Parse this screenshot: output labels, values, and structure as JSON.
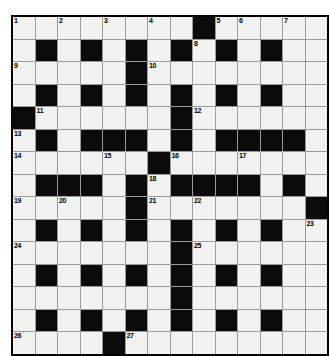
{
  "puzzle": {
    "title": "Crossword Grid",
    "type": "crossword",
    "columns": 14,
    "rows": 15,
    "cell_size_px": 21.5,
    "colors": {
      "background": "#ffffff",
      "cell_fill": "#f2f2f0",
      "block_fill": "#0b0b0b",
      "grid_line": "#9a9a9a",
      "border": "#000000",
      "number_text": "#000000"
    },
    "legend": {
      "0": "white (fillable) cell",
      "1": "black (blocked) cell"
    },
    "grid": [
      [
        0,
        0,
        0,
        0,
        0,
        0,
        0,
        0,
        1,
        0,
        0,
        0,
        0,
        0
      ],
      [
        0,
        1,
        0,
        1,
        0,
        1,
        0,
        1,
        0,
        1,
        0,
        1,
        0,
        0
      ],
      [
        0,
        0,
        0,
        0,
        0,
        1,
        0,
        0,
        0,
        0,
        0,
        0,
        0,
        0
      ],
      [
        0,
        1,
        0,
        1,
        0,
        1,
        0,
        1,
        0,
        1,
        0,
        1,
        0,
        0
      ],
      [
        1,
        0,
        0,
        0,
        0,
        0,
        0,
        1,
        0,
        0,
        0,
        0,
        0,
        0
      ],
      [
        0,
        1,
        0,
        1,
        1,
        1,
        0,
        1,
        0,
        1,
        1,
        1,
        1,
        0
      ],
      [
        0,
        0,
        0,
        0,
        0,
        0,
        1,
        0,
        0,
        0,
        0,
        0,
        0,
        0
      ],
      [
        0,
        1,
        1,
        1,
        0,
        1,
        0,
        1,
        1,
        1,
        1,
        0,
        1,
        0
      ],
      [
        0,
        0,
        0,
        0,
        0,
        1,
        0,
        0,
        0,
        0,
        0,
        0,
        0,
        1
      ],
      [
        0,
        1,
        0,
        1,
        0,
        1,
        0,
        1,
        0,
        1,
        0,
        1,
        0,
        0
      ],
      [
        0,
        0,
        0,
        0,
        0,
        0,
        0,
        1,
        0,
        0,
        0,
        0,
        0,
        0
      ],
      [
        0,
        1,
        0,
        1,
        0,
        1,
        0,
        1,
        0,
        1,
        0,
        1,
        0,
        0
      ],
      [
        0,
        0,
        0,
        0,
        0,
        0,
        0,
        1,
        0,
        0,
        0,
        0,
        0,
        0
      ],
      [
        0,
        1,
        0,
        1,
        0,
        1,
        0,
        1,
        0,
        1,
        0,
        1,
        0,
        0
      ],
      [
        0,
        0,
        0,
        0,
        1,
        0,
        0,
        0,
        0,
        0,
        0,
        0,
        0,
        0
      ]
    ],
    "numbers": [
      {
        "n": 1,
        "row": 0,
        "col": 0
      },
      {
        "n": 2,
        "row": 0,
        "col": 2
      },
      {
        "n": 3,
        "row": 0,
        "col": 4
      },
      {
        "n": 4,
        "row": 0,
        "col": 6
      },
      {
        "n": 5,
        "row": 0,
        "col": 9
      },
      {
        "n": 6,
        "row": 0,
        "col": 10
      },
      {
        "n": 7,
        "row": 0,
        "col": 12
      },
      {
        "n": 8,
        "row": 1,
        "col": 8
      },
      {
        "n": 9,
        "row": 2,
        "col": 0
      },
      {
        "n": 10,
        "row": 2,
        "col": 6
      },
      {
        "n": 11,
        "row": 4,
        "col": 1
      },
      {
        "n": 12,
        "row": 4,
        "col": 8
      },
      {
        "n": 13,
        "row": 5,
        "col": 0
      },
      {
        "n": 14,
        "row": 6,
        "col": 0
      },
      {
        "n": 15,
        "row": 6,
        "col": 4
      },
      {
        "n": 16,
        "row": 6,
        "col": 7
      },
      {
        "n": 17,
        "row": 6,
        "col": 10
      },
      {
        "n": 18,
        "row": 7,
        "col": 6
      },
      {
        "n": 19,
        "row": 8,
        "col": 0
      },
      {
        "n": 20,
        "row": 8,
        "col": 2
      },
      {
        "n": 21,
        "row": 8,
        "col": 6
      },
      {
        "n": 22,
        "row": 8,
        "col": 8
      },
      {
        "n": 23,
        "row": 9,
        "col": 13
      },
      {
        "n": 24,
        "row": 10,
        "col": 0
      },
      {
        "n": 25,
        "row": 10,
        "col": 8
      },
      {
        "n": 26,
        "row": 14,
        "col": 0
      },
      {
        "n": 27,
        "row": 14,
        "col": 5
      }
    ]
  }
}
